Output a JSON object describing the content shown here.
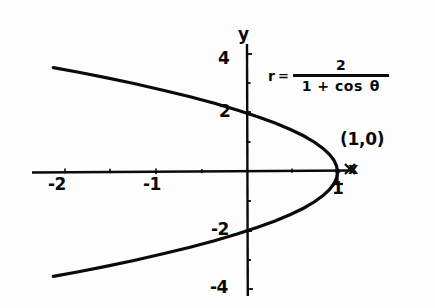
{
  "figure": {
    "background_color": "#fdfdfd",
    "ink_color": "#0a0a0a"
  },
  "axes": {
    "x_axis_name": "x",
    "y_axis_name": "y",
    "x_tick_labels": [
      "-2",
      "-1",
      "1"
    ],
    "y_tick_labels": [
      "4",
      "2",
      "-2",
      "-4"
    ]
  },
  "annotation": {
    "point_label": "(1,0)"
  },
  "equation": {
    "lhs": "r",
    "relation": "=",
    "numerator": "2",
    "denominator": "1 + cos",
    "variable": "θ"
  },
  "chart_data": {
    "type": "line",
    "title": "",
    "xlabel": "x",
    "ylabel": "y",
    "xlim": [
      -2.36,
      1.6
    ],
    "ylim": [
      -4.6,
      4.6
    ],
    "grid": false,
    "legend": null,
    "equation_text": "r = 2 / (1 + cos θ)",
    "curve_description": "Polar conic (parabola) r = 2/(1 + cos theta); cartesian form y^2 = 4 - 4x, opening to the left with vertex at (1,0) and focus at the origin.",
    "xticks": [
      -2,
      -1,
      1
    ],
    "xticklabels": [
      "-2",
      "-1",
      "1"
    ],
    "yticks": [
      4,
      2,
      -2,
      -4
    ],
    "yticklabels": [
      "4",
      "2",
      "-2",
      "-4"
    ],
    "annotations": [
      {
        "text": "(1,0)",
        "x": 1,
        "y": 0,
        "marker": "x"
      }
    ],
    "series": [
      {
        "name": "r = 2/(1 + cos theta)",
        "x": [
          -2.14,
          -1.86,
          -1.56,
          -1.25,
          -0.94,
          -0.64,
          -0.36,
          -0.11,
          0.11,
          0.31,
          0.48,
          0.63,
          0.75,
          0.84,
          0.91,
          0.96,
          0.99,
          1.0,
          0.99,
          0.96,
          0.91,
          0.84,
          0.75,
          0.63,
          0.48,
          0.31,
          0.11,
          -0.11,
          -0.36,
          -0.64,
          -0.94,
          -1.25,
          -1.56,
          -1.86,
          -2.14
        ],
        "y": [
          3.54,
          3.38,
          3.2,
          3.0,
          2.78,
          2.56,
          2.33,
          2.1,
          1.88,
          1.66,
          1.44,
          1.22,
          1.0,
          0.8,
          0.6,
          0.4,
          0.2,
          0.0,
          -0.2,
          -0.4,
          -0.6,
          -0.8,
          -1.0,
          -1.22,
          -1.44,
          -1.66,
          -1.88,
          -2.1,
          -2.33,
          -2.56,
          -2.78,
          -3.0,
          -3.2,
          -3.38,
          -3.54
        ]
      }
    ]
  }
}
